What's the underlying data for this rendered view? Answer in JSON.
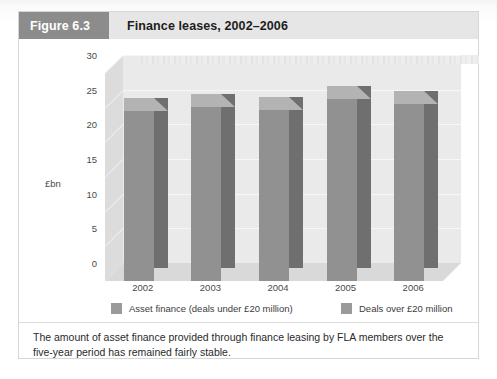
{
  "figure": {
    "badge": "Figure 6.3",
    "title": "Finance leases, 2002–2006",
    "caption": "The amount of asset finance provided through finance leasing by FLA members over the five-year period has remained fairly stable."
  },
  "colors": {
    "badge_background": "#8c8c8c",
    "header_background": "#e6e6e6",
    "bar_front": "#919191",
    "bar_side": "#6f6f6f",
    "bar_top": "#b3b3b3",
    "wall": "#eaeaea",
    "floor": "#d9d9d9",
    "gridline": "#f7f7f7",
    "legend_swatch": "#9a9a9a"
  },
  "chart_data": {
    "type": "bar",
    "title": "Finance leases, 2002–2006",
    "xlabel": "",
    "ylabel": "£bn",
    "categories": [
      "2002",
      "2003",
      "2004",
      "2005",
      "2006"
    ],
    "series": [
      {
        "name": "Asset finance (deals under £20 million)",
        "values": [
          24.5,
          25.1,
          24.7,
          26.2,
          25.6
        ]
      }
    ],
    "values": [
      24.5,
      25.1,
      24.7,
      26.2,
      25.6
    ],
    "ylim": [
      0,
      30
    ],
    "yticks": [
      0,
      5,
      10,
      15,
      20,
      25,
      30
    ],
    "ytick_labels": [
      "0",
      "5",
      "10",
      "15",
      "20",
      "25",
      "30"
    ],
    "grid": true,
    "legend_position": "bottom",
    "legend": [
      "Asset finance (deals under £20 million)",
      "Deals over £20 million"
    ],
    "three_d": true
  }
}
